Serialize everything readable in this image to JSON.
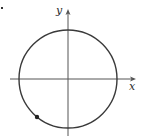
{
  "figure": {
    "type": "unit-circle-diagram",
    "axes": {
      "x_label": "x",
      "y_label": "y"
    },
    "circle": {
      "center": [
        68,
        79
      ],
      "radius": 49
    },
    "point": {
      "position": [
        37,
        117
      ],
      "quadrant": "III"
    },
    "colors": {
      "stroke": "#3a3a3a",
      "axis": "#555555",
      "point": "#222222",
      "background": "#ffffff"
    }
  }
}
